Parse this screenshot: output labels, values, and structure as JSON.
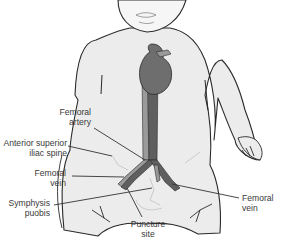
{
  "diagram": {
    "colors": {
      "skin": "#ececec",
      "outline": "#2a2a2a",
      "heart": "#6e6e6e",
      "artery": "#5f5f5f",
      "vein": "#9a9a9a",
      "label_text": "#3a3a3a",
      "leader_line": "#333333"
    },
    "labels": {
      "femoral_artery": {
        "line1": "Femoral",
        "line2": "artery"
      },
      "asis": {
        "line1": "Anterior superior",
        "line2": "iliac spine"
      },
      "femoral_vein_left": {
        "line1": "Femoral",
        "line2": "vein"
      },
      "symphysis": {
        "line1": "Symphysis",
        "line2": "puobis"
      },
      "puncture": {
        "line1": "Puncture",
        "line2": "site"
      },
      "femoral_vein_right": {
        "line1": "Femoral",
        "line2": "vein"
      }
    }
  }
}
